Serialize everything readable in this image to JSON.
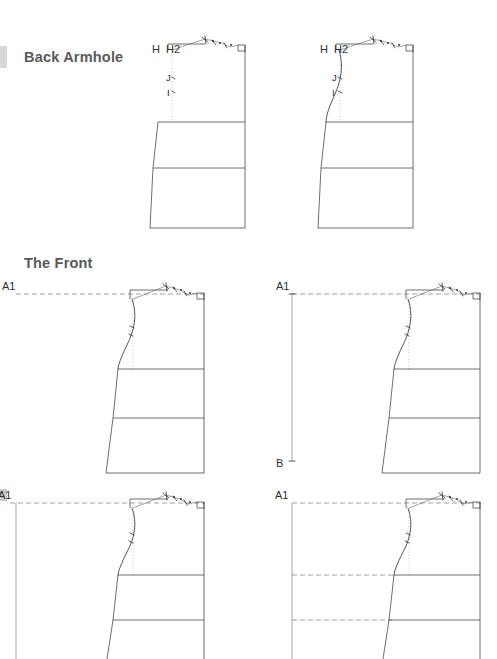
{
  "document": {
    "background_color": "#ffffff",
    "ink_color": "#4a4a4a",
    "heading_color": "#58595b"
  },
  "sections": [
    {
      "id": "back-armhole",
      "title": "Back Armhole",
      "figures": [
        {
          "id": "back-left",
          "caption": "",
          "labels": [
            {
              "text": "H",
              "role": "point-label"
            },
            {
              "text": "H2",
              "role": "point-label"
            },
            {
              "text": "J",
              "role": "point-label"
            },
            {
              "text": "I",
              "role": "point-label"
            }
          ]
        },
        {
          "id": "back-right",
          "caption": "",
          "labels": [
            {
              "text": "H",
              "role": "point-label"
            },
            {
              "text": "H2",
              "role": "point-label"
            },
            {
              "text": "J",
              "role": "point-label"
            },
            {
              "text": "I",
              "role": "point-label"
            }
          ]
        }
      ]
    },
    {
      "id": "the-front",
      "title": "The Front",
      "figures": [
        {
          "id": "front-top-left",
          "caption": "",
          "labels": [
            {
              "text": "A1",
              "role": "point-label"
            }
          ]
        },
        {
          "id": "front-top-right",
          "caption": "",
          "labels": [
            {
              "text": "A1",
              "role": "point-label"
            },
            {
              "text": "B",
              "role": "point-label"
            }
          ]
        },
        {
          "id": "front-bottom-left",
          "caption": "",
          "labels": [
            {
              "text": "A1",
              "role": "point-label"
            }
          ]
        },
        {
          "id": "front-bottom-right",
          "caption": "",
          "labels": [
            {
              "text": "A1",
              "role": "point-label"
            }
          ]
        }
      ]
    }
  ],
  "labels": {
    "back_left": {
      "h": "H",
      "h2": "H2",
      "j": "J",
      "i": "I"
    },
    "back_right": {
      "h": "H",
      "h2": "H2",
      "j": "J",
      "i": "I"
    },
    "front_top_left": {
      "a1": "A1"
    },
    "front_top_right": {
      "a1": "A1",
      "b": "B"
    },
    "front_bottom_left": {
      "a1": "A1"
    },
    "front_bottom_right": {
      "a1": "A1"
    }
  }
}
